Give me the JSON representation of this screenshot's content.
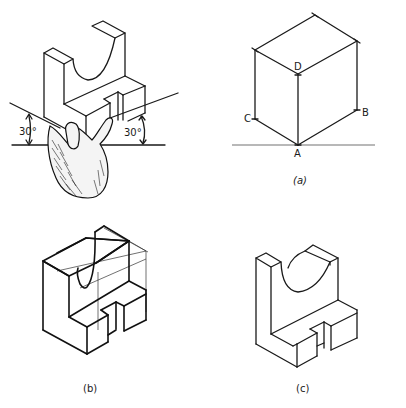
{
  "figure": {
    "type": "isometric-drawing-illustration",
    "panels": [
      {
        "id": "hand-view",
        "caption": "",
        "angle_labels": [
          "30°",
          "30°"
        ],
        "description": "Object held in hand tilted to show isometric axes at 30° to horizontal"
      },
      {
        "id": "a",
        "caption": "(a)",
        "vertex_labels": {
          "A": "A",
          "B": "B",
          "C": "C",
          "D": "D"
        },
        "description": "Isometric box construction with axes from A"
      },
      {
        "id": "b",
        "caption": "(b)",
        "description": "Construction of object inside isometric box with light construction lines"
      },
      {
        "id": "c",
        "caption": "(c)",
        "description": "Finished isometric drawing of the object"
      }
    ]
  },
  "colors": {
    "ink": "#1a1a1a",
    "paper": "#ffffff"
  }
}
